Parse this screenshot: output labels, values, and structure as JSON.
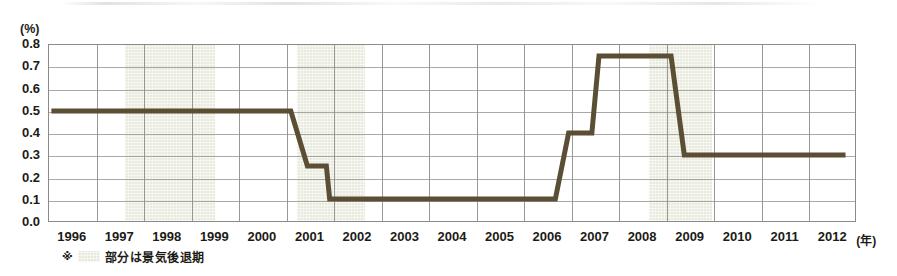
{
  "chart_data": {
    "type": "line",
    "title": "",
    "subtitle": "",
    "xlabel": "年",
    "ylabel": "(%)",
    "y_unit_label": "(%)",
    "x_unit_label": "(年)",
    "ylim": [
      0.0,
      0.8
    ],
    "xlim": [
      1995.5,
      2012.5
    ],
    "grid": true,
    "legend_position": "none",
    "step_interpolation": true,
    "line_color": "#5a4f35",
    "recession_band_color": "#e9eade",
    "plot_border_color": "#8a8a86",
    "gridline_color": "#9a9a95",
    "y_ticks": [
      "0.0",
      "0.1",
      "0.2",
      "0.3",
      "0.4",
      "0.5",
      "0.6",
      "0.7",
      "0.8"
    ],
    "y_tick_values": [
      0.0,
      0.1,
      0.2,
      0.3,
      0.4,
      0.5,
      0.6,
      0.7,
      0.8
    ],
    "x_ticks": [
      "1996",
      "1997",
      "1998",
      "1999",
      "2000",
      "2001",
      "2002",
      "2003",
      "2004",
      "2005",
      "2006",
      "2007",
      "2008",
      "2009",
      "2010",
      "2011",
      "2012"
    ],
    "x_tick_values": [
      1996,
      1997,
      1998,
      1999,
      2000,
      2001,
      2002,
      2003,
      2004,
      2005,
      2006,
      2007,
      2008,
      2009,
      2010,
      2011,
      2012
    ],
    "series": [
      {
        "name": "政策金利",
        "color": "#5a4f35",
        "points": [
          {
            "x": 1995.55,
            "y": 0.5
          },
          {
            "x": 2000.6,
            "y": 0.5
          },
          {
            "x": 2000.95,
            "y": 0.25
          },
          {
            "x": 2001.35,
            "y": 0.25
          },
          {
            "x": 2001.42,
            "y": 0.1
          },
          {
            "x": 2006.18,
            "y": 0.1
          },
          {
            "x": 2006.46,
            "y": 0.4
          },
          {
            "x": 2006.95,
            "y": 0.4
          },
          {
            "x": 2007.1,
            "y": 0.75
          },
          {
            "x": 2008.62,
            "y": 0.75
          },
          {
            "x": 2008.9,
            "y": 0.3
          },
          {
            "x": 2012.3,
            "y": 0.3
          }
        ]
      }
    ],
    "recession_bands": [
      {
        "label": "景気後退期 1",
        "start": 1997.1,
        "end": 1999.0
      },
      {
        "label": "景気後退期 2",
        "start": 2000.72,
        "end": 2002.15
      },
      {
        "label": "景気後退期 3",
        "start": 2008.12,
        "end": 2009.45
      }
    ],
    "annotations": []
  },
  "footnote": {
    "mark": "※",
    "swatch_label": "recession-band-swatch",
    "text": "部分は景気後退期"
  }
}
